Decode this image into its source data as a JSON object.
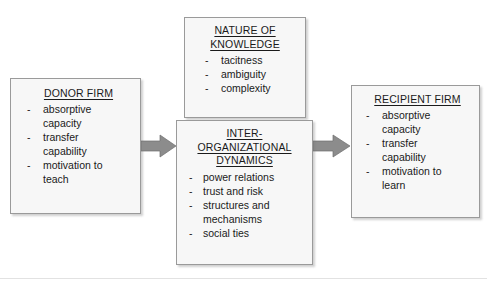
{
  "diagram": {
    "background_color": "#ffffff",
    "box_fill": "#f7f7f7",
    "box_border": "#9a9a9a",
    "arrow_color": "#8c8c8c",
    "text_color": "#1a1a1a",
    "boxes": {
      "donor_firm": {
        "title": "DONOR FIRM",
        "bullet": "-",
        "items": [
          "absorptive",
          "capacity",
          "transfer",
          "capability",
          "motivation to",
          "teach"
        ],
        "item_lines": [
          {
            "dash": "-",
            "text": "absorptive"
          },
          {
            "dash": "",
            "text": "capacity"
          },
          {
            "dash": "-",
            "text": "transfer"
          },
          {
            "dash": "",
            "text": "capability"
          },
          {
            "dash": "-",
            "text": "motivation to"
          },
          {
            "dash": "",
            "text": "teach"
          }
        ]
      },
      "nature_of_knowledge": {
        "title_line_1": "NATURE OF",
        "title_line_2": "KNOWLEDGE",
        "bullet": "-",
        "item_lines": [
          {
            "dash": "-",
            "text": "tacitness"
          },
          {
            "dash": "-",
            "text": "ambiguity"
          },
          {
            "dash": "-",
            "text": "complexity"
          }
        ]
      },
      "inter_organizational_dynamics": {
        "title_line_1": "INTER-",
        "title_line_2": "ORGANIZATIONAL",
        "title_line_3": "DYNAMICS",
        "bullet": "-",
        "item_lines": [
          {
            "dash": "-",
            "text": "power relations"
          },
          {
            "dash": "-",
            "text": "trust and risk"
          },
          {
            "dash": "-",
            "text": "structures and"
          },
          {
            "dash": "",
            "text": "mechanisms"
          },
          {
            "dash": "-",
            "text": "social ties"
          }
        ]
      },
      "recipient_firm": {
        "title": "RECIPIENT FIRM",
        "bullet": "-",
        "item_lines": [
          {
            "dash": "-",
            "text": "absorptive"
          },
          {
            "dash": "",
            "text": "capacity"
          },
          {
            "dash": "-",
            "text": "transfer"
          },
          {
            "dash": "",
            "text": "capability"
          },
          {
            "dash": "-",
            "text": "motivation to"
          },
          {
            "dash": "",
            "text": "learn"
          }
        ]
      }
    },
    "arrows": [
      {
        "name": "donor-to-inter",
        "direction": "right"
      },
      {
        "name": "inter-to-recipient",
        "direction": "right"
      }
    ]
  }
}
